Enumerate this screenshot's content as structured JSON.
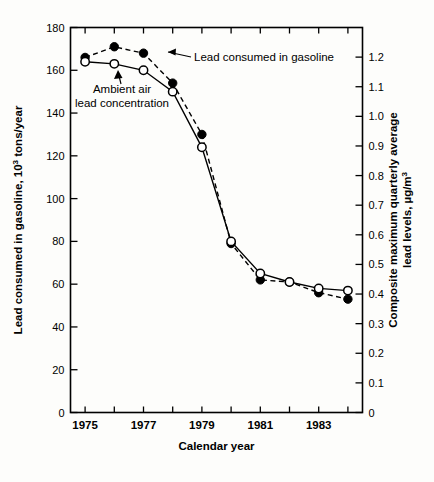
{
  "chart_data": {
    "type": "line",
    "title": "",
    "xlabel": "Calendar year",
    "ylabel": "Lead consumed in gasoline, 10³ tons/year",
    "y2label": "Composite maximum quarterly average lead levels, µg/m³",
    "x": [
      1975,
      1976,
      1977,
      1978,
      1979,
      1980,
      1981,
      1982,
      1983,
      1984
    ],
    "xlim": [
      1974.5,
      1984.5
    ],
    "ylim": [
      0,
      180
    ],
    "y2lim": [
      0,
      1.3
    ],
    "grid": false,
    "legend_position": "inline-annotations",
    "x_tick_values": [
      1975,
      1976,
      1977,
      1978,
      1979,
      1980,
      1981,
      1982,
      1983,
      1984
    ],
    "x_tick_labels": [
      "1975",
      "",
      "1977",
      "",
      "1979",
      "",
      "1981",
      "",
      "1983",
      ""
    ],
    "y_tick_values": [
      0,
      20,
      40,
      60,
      80,
      100,
      120,
      140,
      160,
      180
    ],
    "y_tick_labels": [
      "0",
      "20",
      "40",
      "60",
      "80",
      "100",
      "120",
      "140",
      "160",
      "180"
    ],
    "y2_tick_values": [
      0,
      0.1,
      0.2,
      0.3,
      0.4,
      0.5,
      0.6,
      0.7,
      0.8,
      0.9,
      1.0,
      1.1,
      1.2
    ],
    "y2_tick_labels": [
      "0",
      "0.1",
      "0.2",
      "0.3",
      "0.4",
      "0.5",
      "0.6",
      "0.7",
      "0.8",
      "0.9",
      "1.0",
      "1.1",
      "1.2"
    ],
    "series": [
      {
        "name": "Lead consumed in gasoline",
        "marker": "filled-circle",
        "linestyle": "dashed",
        "axis": "left",
        "values": [
          166,
          171,
          168,
          154,
          130,
          79,
          62,
          61,
          56,
          53
        ]
      },
      {
        "name": "Ambient air lead concentration",
        "marker": "open-circle",
        "linestyle": "solid",
        "axis": "left",
        "values": [
          164,
          163,
          160,
          150,
          124,
          80,
          65,
          61,
          58,
          57
        ]
      }
    ],
    "series_right_axis_values": [
      {
        "name": "Ambient air lead concentration",
        "units": "µg/m³",
        "values": [
          1.18,
          1.17,
          1.15,
          1.08,
          0.89,
          0.58,
          0.47,
          0.44,
          0.42,
          0.41
        ]
      },
      {
        "name": "Lead consumed in gasoline",
        "units": "10³ tons/year",
        "values": [
          166,
          171,
          168,
          154,
          130,
          79,
          62,
          61,
          56,
          53
        ]
      }
    ],
    "annotations": [
      {
        "name": "lead-consumed-annotation",
        "text": "Lead consumed in gasoline",
        "points_to_series": "Lead consumed in gasoline"
      },
      {
        "name": "ambient-air-annotation",
        "text_line1": "Ambient air",
        "text_line2": "lead concentration",
        "points_to_series": "Ambient air lead concentration"
      }
    ]
  },
  "axes": {
    "y_left_title_part1": "Lead consumed in gasoline, 10",
    "y_left_title_sup": "3",
    "y_left_title_part2": " tons/year",
    "y_right_title_line1": "Composite maximum quarterly average",
    "y_right_title_line2_part1": "lead levels, µg/m",
    "y_right_title_line2_sup": "3",
    "x_title": "Calendar year"
  },
  "colors": {
    "ink": "#000000",
    "background": "#fdfdfb",
    "marker_fill": "#000000",
    "marker_open": "#ffffff"
  }
}
